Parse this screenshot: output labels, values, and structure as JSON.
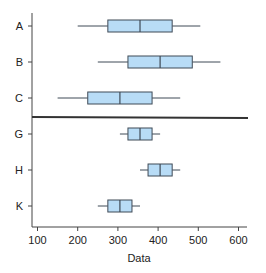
{
  "chart_data": {
    "type": "boxplot",
    "title": "",
    "xlabel": "Data",
    "ylabel": "",
    "xlim": [
      80,
      625
    ],
    "x_ticks": [
      100,
      200,
      300,
      400,
      500,
      600
    ],
    "x_tick_labels": [
      "100",
      "200",
      "300",
      "400",
      "500",
      "600"
    ],
    "grid": false,
    "orientation": "horizontal",
    "groups": [
      {
        "name": "top",
        "categories": [
          "A",
          "B",
          "C"
        ],
        "boxes": [
          {
            "label": "A",
            "whisker_low": 200,
            "q1": 275,
            "median": 355,
            "q3": 435,
            "whisker_high": 505
          },
          {
            "label": "B",
            "whisker_low": 250,
            "q1": 325,
            "median": 405,
            "q3": 485,
            "whisker_high": 555
          },
          {
            "label": "C",
            "whisker_low": 150,
            "q1": 225,
            "median": 305,
            "q3": 385,
            "whisker_high": 455
          }
        ]
      },
      {
        "name": "bottom",
        "categories": [
          "G",
          "H",
          "K"
        ],
        "boxes": [
          {
            "label": "G",
            "whisker_low": 305,
            "q1": 325,
            "median": 355,
            "q3": 385,
            "whisker_high": 405
          },
          {
            "label": "H",
            "whisker_low": 355,
            "q1": 375,
            "median": 405,
            "q3": 435,
            "whisker_high": 455
          },
          {
            "label": "K",
            "whisker_low": 250,
            "q1": 275,
            "median": 305,
            "q3": 335,
            "whisker_high": 355
          }
        ]
      }
    ],
    "colors": {
      "box_fill": "#b8dcf6",
      "box_stroke": "#3f4a56",
      "whisker": "#3f4a56",
      "separator": "#333333",
      "axis": "#444444"
    }
  }
}
